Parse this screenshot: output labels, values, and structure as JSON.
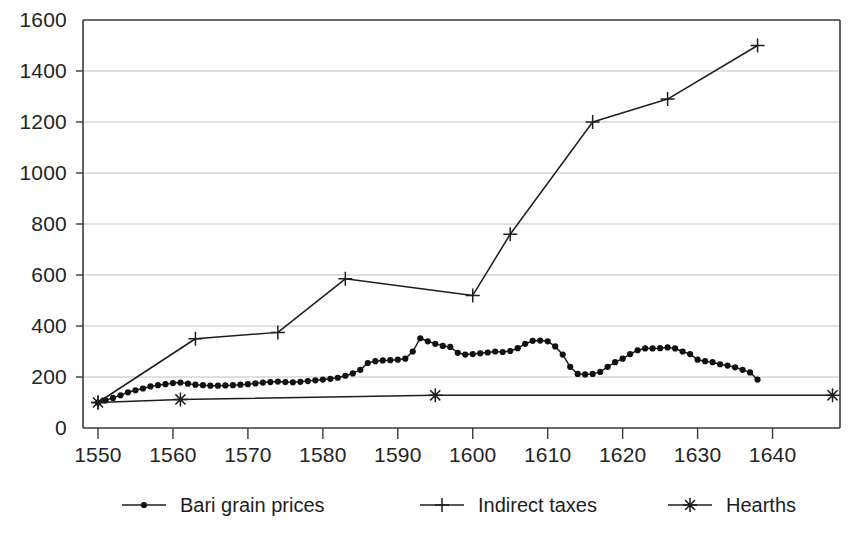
{
  "chart_data": {
    "type": "line",
    "title": "",
    "subtitle": "",
    "xlabel": "",
    "ylabel": "",
    "xlim": [
      1548,
      1649
    ],
    "ylim": [
      0,
      1600
    ],
    "xticks": [
      1550,
      1560,
      1570,
      1580,
      1590,
      1600,
      1610,
      1620,
      1630,
      1640
    ],
    "yticks": [
      0,
      200,
      400,
      600,
      800,
      1000,
      1200,
      1400,
      1600
    ],
    "xtick_labels": [
      "1550",
      "1560",
      "1570",
      "1580",
      "1590",
      "1600",
      "1610",
      "1620",
      "1630",
      "1640"
    ],
    "ytick_labels": [
      "0",
      "200",
      "400",
      "600",
      "800",
      "1000",
      "1200",
      "1400",
      "1600"
    ],
    "grid": "horizontal",
    "legend_position": "bottom",
    "series": [
      {
        "name": "Bari grain prices",
        "marker": "dot",
        "points": [
          [
            1550,
            100
          ],
          [
            1551,
            108
          ],
          [
            1552,
            118
          ],
          [
            1553,
            128
          ],
          [
            1554,
            140
          ],
          [
            1555,
            148
          ],
          [
            1556,
            155
          ],
          [
            1557,
            163
          ],
          [
            1558,
            168
          ],
          [
            1559,
            172
          ],
          [
            1560,
            176
          ],
          [
            1561,
            178
          ],
          [
            1562,
            174
          ],
          [
            1563,
            170
          ],
          [
            1564,
            168
          ],
          [
            1565,
            166
          ],
          [
            1566,
            166
          ],
          [
            1567,
            167
          ],
          [
            1568,
            168
          ],
          [
            1569,
            170
          ],
          [
            1570,
            172
          ],
          [
            1571,
            175
          ],
          [
            1572,
            178
          ],
          [
            1573,
            180
          ],
          [
            1574,
            182
          ],
          [
            1575,
            180
          ],
          [
            1576,
            179
          ],
          [
            1577,
            181
          ],
          [
            1578,
            184
          ],
          [
            1579,
            187
          ],
          [
            1580,
            190
          ],
          [
            1581,
            193
          ],
          [
            1582,
            197
          ],
          [
            1583,
            205
          ],
          [
            1584,
            214
          ],
          [
            1585,
            228
          ],
          [
            1586,
            255
          ],
          [
            1587,
            262
          ],
          [
            1588,
            265
          ],
          [
            1589,
            266
          ],
          [
            1590,
            268
          ],
          [
            1591,
            272
          ],
          [
            1592,
            300
          ],
          [
            1593,
            352
          ],
          [
            1594,
            340
          ],
          [
            1595,
            330
          ],
          [
            1596,
            322
          ],
          [
            1597,
            318
          ],
          [
            1598,
            295
          ],
          [
            1599,
            288
          ],
          [
            1600,
            290
          ],
          [
            1601,
            293
          ],
          [
            1602,
            296
          ],
          [
            1603,
            300
          ],
          [
            1604,
            298
          ],
          [
            1605,
            302
          ],
          [
            1606,
            313
          ],
          [
            1607,
            330
          ],
          [
            1608,
            342
          ],
          [
            1609,
            343
          ],
          [
            1610,
            340
          ],
          [
            1611,
            320
          ],
          [
            1612,
            288
          ],
          [
            1613,
            240
          ],
          [
            1614,
            212
          ],
          [
            1615,
            210
          ],
          [
            1616,
            212
          ],
          [
            1617,
            220
          ],
          [
            1618,
            240
          ],
          [
            1619,
            258
          ],
          [
            1620,
            272
          ],
          [
            1621,
            290
          ],
          [
            1622,
            305
          ],
          [
            1623,
            312
          ],
          [
            1624,
            312
          ],
          [
            1625,
            313
          ],
          [
            1626,
            316
          ],
          [
            1627,
            312
          ],
          [
            1628,
            300
          ],
          [
            1629,
            290
          ],
          [
            1630,
            268
          ],
          [
            1631,
            262
          ],
          [
            1632,
            258
          ],
          [
            1633,
            250
          ],
          [
            1634,
            245
          ],
          [
            1635,
            238
          ],
          [
            1636,
            228
          ],
          [
            1637,
            218
          ],
          [
            1638,
            190
          ]
        ]
      },
      {
        "name": "Indirect taxes",
        "marker": "plus",
        "points": [
          [
            1550,
            100
          ],
          [
            1563,
            350
          ],
          [
            1574,
            375
          ],
          [
            1583,
            585
          ],
          [
            1600,
            520
          ],
          [
            1605,
            760
          ],
          [
            1616,
            1200
          ],
          [
            1626,
            1290
          ],
          [
            1638,
            1500
          ]
        ]
      },
      {
        "name": "Hearths",
        "marker": "star",
        "points": [
          [
            1550,
            100
          ],
          [
            1561,
            112
          ],
          [
            1595,
            128
          ],
          [
            1648,
            128
          ]
        ]
      }
    ]
  }
}
